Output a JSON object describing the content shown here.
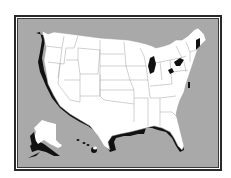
{
  "figure": {
    "regions_shown": [
      "Contiguous United States",
      "Alaska",
      "Hawaii"
    ],
    "style": "white states with black coastline drop-shadow on gray background inside double-line frame",
    "colors": {
      "background": "#a9a9a9",
      "land": "#ffffff",
      "shadow": "#111111",
      "state_border": "#9a9a9a",
      "frame": "#2a2a2a"
    }
  }
}
